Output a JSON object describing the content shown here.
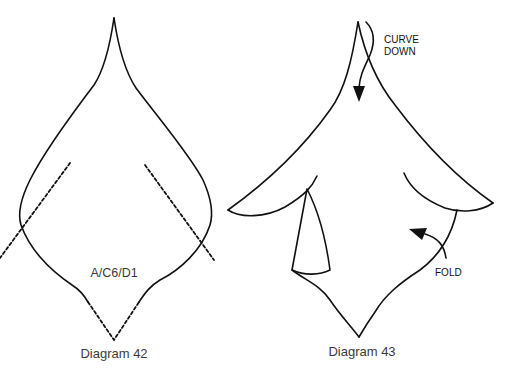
{
  "figure": {
    "diagrams": [
      {
        "id": "diagram-42",
        "caption": "Diagram 42",
        "pattern_code": "A/C6/D1",
        "stroke_color": "#111111",
        "elements": [
          "petal-outline",
          "left-dashed-fold-line",
          "right-dashed-fold-line",
          "bottom-dashed-point"
        ]
      },
      {
        "id": "diagram-43",
        "caption": "Diagram 43",
        "annotations": {
          "curve_down": [
            "CURVE",
            "DOWN"
          ],
          "fold": "FOLD"
        },
        "stroke_color": "#111111",
        "elements": [
          "petal-outline",
          "curl-arrow",
          "fold-arrow",
          "left-fold-flap",
          "right-fold-flap"
        ]
      }
    ]
  }
}
